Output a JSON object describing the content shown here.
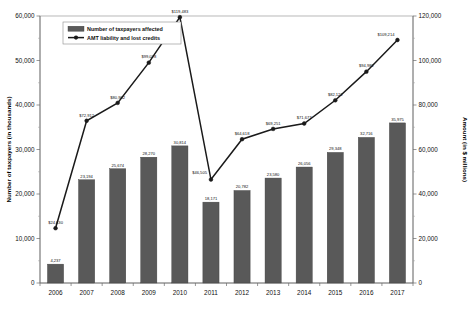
{
  "chart_data": {
    "type": "bar",
    "title": "",
    "subtitle": "",
    "categories": [
      "2006",
      "2007",
      "2008",
      "2009",
      "2010",
      "2011",
      "2012",
      "2013",
      "2014",
      "2015",
      "2016",
      "2017"
    ],
    "xlabel": "",
    "ylabel": "Number of taxpayers (in thousands)",
    "y2label": "Amount (in $ millions)",
    "ylim": [
      0,
      60000
    ],
    "y2lim": [
      0,
      120000
    ],
    "yticks": [
      "0",
      "10,000",
      "20,000",
      "30,000",
      "40,000",
      "50,000",
      "60,000"
    ],
    "y2ticks": [
      "0",
      "20,000",
      "40,000",
      "60,000",
      "80,000",
      "100,000",
      "120,000"
    ],
    "grid": false,
    "legend_position": "upper-left",
    "series": [
      {
        "name": "Number of taxpayers affected",
        "type": "bar",
        "axis": "left",
        "color": "#595959",
        "values": [
          4237,
          23194,
          25674,
          28270,
          30814,
          18171,
          20782,
          23580,
          26056,
          29348,
          32716,
          35975
        ],
        "labels": [
          "4,237",
          "23,194",
          "25,674",
          "28,270",
          "30,814",
          "18,171",
          "20,782",
          "23,580",
          "26,056",
          "29,348",
          "32,716",
          "35,975"
        ]
      },
      {
        "name": "AMT liability and lost credits",
        "type": "line",
        "axis": "right",
        "color": "#1a1a1a",
        "values": [
          24630,
          72912,
          80962,
          99028,
          119483,
          46505,
          64618,
          69251,
          71677,
          82122,
          94982,
          109214
        ],
        "labels": [
          "$24,630",
          "$72,912",
          "$80,962",
          "$99,028",
          "$119,483",
          "$46,505",
          "$64,618",
          "$69,251",
          "$71,677",
          "$82,122",
          "$94,982",
          "$109,214"
        ]
      }
    ]
  }
}
